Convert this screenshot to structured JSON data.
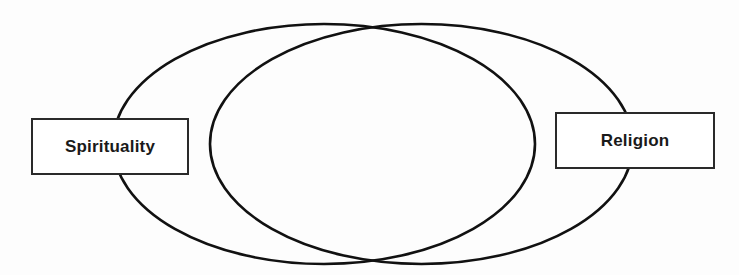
{
  "diagram": {
    "type": "venn-overlap",
    "sets": [
      {
        "id": "spirituality",
        "label": "Spirituality",
        "position": "left"
      },
      {
        "id": "religion",
        "label": "Religion",
        "position": "right"
      }
    ],
    "colors": {
      "stroke": "#111111",
      "background": "#fdfdfd",
      "label_fill": "#ffffff",
      "label_border": "#2a2a2a",
      "text": "#1a1a1a"
    }
  }
}
